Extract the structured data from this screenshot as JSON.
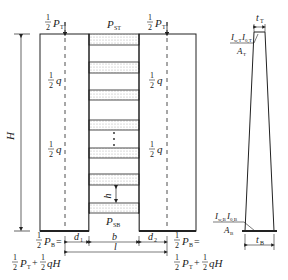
{
  "figure": {
    "left_diagram": {
      "top_left_load": {
        "frac": "1/2",
        "symbol": "P",
        "sub": "T"
      },
      "top_right_load": {
        "frac": "1/2",
        "symbol": "P",
        "sub": "T"
      },
      "top_slab_load": {
        "symbol": "P",
        "sub": "ST"
      },
      "bottom_slab_load": {
        "symbol": "P",
        "sub": "SB"
      },
      "left_distributed_loads": [
        {
          "frac": "1/2",
          "symbol": "q"
        },
        {
          "frac": "1/2",
          "symbol": "q"
        }
      ],
      "right_distributed_loads": [
        {
          "frac": "1/2",
          "symbol": "q"
        },
        {
          "frac": "1/2",
          "symbol": "q"
        }
      ],
      "height_label": "H",
      "story_height_label": "h",
      "ellipsis": "⋮",
      "bottom_left_reaction": {
        "line1": "½P_B=",
        "line2": "½P_T+½qH"
      },
      "bottom_right_reaction": {
        "line1": "½P_B=",
        "line2": "½P_T+½qH"
      },
      "dimensions": {
        "d1": "d₁",
        "b": "b",
        "d2": "d₂",
        "l": "l"
      },
      "slab_bands_y": [
        34,
        62,
        90,
        120,
        148,
        174,
        203
      ]
    },
    "right_diagram": {
      "top_width_label": "t_T",
      "bottom_width_label": "t_B",
      "top_property": {
        "numerator": "I_w,T I_0,T",
        "denominator": "A_T"
      },
      "bottom_property": {
        "numerator": "I_w,B I_0,B",
        "denominator": "A_B"
      }
    },
    "colors": {
      "line": "#222222",
      "hatch": "#bdbdbd"
    }
  }
}
